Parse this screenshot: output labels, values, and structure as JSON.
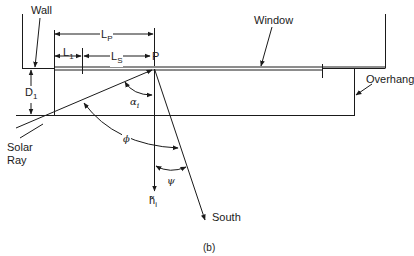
{
  "diagram": {
    "caption": "(b)",
    "labels": {
      "wall": "Wall",
      "window": "Window",
      "overhang": "Overhang",
      "solar_ray_line1": "Solar",
      "solar_ray_line2": "Ray",
      "south": "South",
      "point_p": "P",
      "lp_main": "L",
      "lp_sub": "P",
      "l1_main": "L",
      "l1_sub": "1",
      "ls_main": "L",
      "ls_sub": "S",
      "d1_main": "D",
      "d1_sub": "1",
      "alpha_main": "α",
      "alpha_sub": "i",
      "phi": "ϕ",
      "psi": "ψ",
      "h_main": "h̃",
      "h_sub": "i"
    },
    "colors": {
      "ink": "#1a1a1a",
      "background": "#ffffff"
    }
  }
}
